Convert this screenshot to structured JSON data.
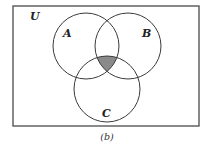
{
  "diagram": {
    "type": "venn",
    "universe": {
      "label": "U",
      "rect": {
        "x": 13,
        "y": 6,
        "width": 186,
        "height": 120
      },
      "label_pos": {
        "x": 30,
        "y": 20
      }
    },
    "sets": [
      {
        "name": "A",
        "label": "A",
        "cx": 86,
        "cy": 46,
        "r": 33,
        "label_pos": {
          "x": 66,
          "y": 34
        }
      },
      {
        "name": "B",
        "label": "B",
        "cx": 128,
        "cy": 46,
        "r": 33,
        "label_pos": {
          "x": 145,
          "y": 34
        }
      },
      {
        "name": "C",
        "label": "C",
        "cx": 107,
        "cy": 89,
        "r": 33,
        "label_pos": {
          "x": 106,
          "y": 115
        }
      }
    ],
    "shaded_region": {
      "description": "A ∩ B ∩ C",
      "color": "#8a8a8a"
    },
    "caption": "(b)",
    "colors": {
      "stroke": "#3a3a3a",
      "background": "#ffffff",
      "shade": "#8a8a8a"
    }
  }
}
